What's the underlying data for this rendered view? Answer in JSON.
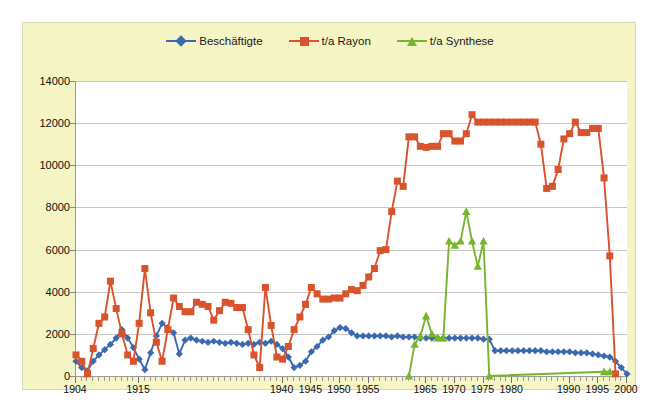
{
  "chart_data": {
    "type": "line",
    "title": "",
    "subtitle": "",
    "xlabel": "",
    "ylabel": "",
    "xlim": [
      1904,
      2000
    ],
    "ylim": [
      0,
      14000
    ],
    "ytick_values": [
      0,
      2000,
      4000,
      6000,
      8000,
      10000,
      12000,
      14000
    ],
    "ytick_labels": [
      "0",
      "2000",
      "4000",
      "6000",
      "8000",
      "10000",
      "12000",
      "14000"
    ],
    "xtick_labels": [
      "1904",
      "1915",
      "1940",
      "1945",
      "1950",
      "1955",
      "1965",
      "1970",
      "1975",
      "1980",
      "1990",
      "1995",
      "2000"
    ],
    "xtick_values": [
      1904,
      1915,
      1940,
      1945,
      1950,
      1955,
      1965,
      1970,
      1975,
      1980,
      1990,
      1995,
      2000
    ],
    "grid": true,
    "legend_position": "top-center",
    "series": [
      {
        "name": "Beschäftigte",
        "color": "#3b69b0",
        "marker": "diamond",
        "points": [
          [
            1904,
            700
          ],
          [
            1905,
            400
          ],
          [
            1906,
            250
          ],
          [
            1907,
            700
          ],
          [
            1908,
            1000
          ],
          [
            1909,
            1250
          ],
          [
            1910,
            1500
          ],
          [
            1911,
            1800
          ],
          [
            1912,
            2200
          ],
          [
            1913,
            1800
          ],
          [
            1914,
            1350
          ],
          [
            1915,
            800
          ],
          [
            1916,
            300
          ],
          [
            1917,
            1100
          ],
          [
            1918,
            1900
          ],
          [
            1919,
            2500
          ],
          [
            1920,
            2300
          ],
          [
            1921,
            2050
          ],
          [
            1922,
            1050
          ],
          [
            1923,
            1700
          ],
          [
            1924,
            1800
          ],
          [
            1925,
            1700
          ],
          [
            1926,
            1650
          ],
          [
            1927,
            1600
          ],
          [
            1928,
            1650
          ],
          [
            1929,
            1600
          ],
          [
            1930,
            1550
          ],
          [
            1931,
            1600
          ],
          [
            1932,
            1550
          ],
          [
            1933,
            1500
          ],
          [
            1934,
            1550
          ],
          [
            1935,
            1500
          ],
          [
            1936,
            1600
          ],
          [
            1937,
            1550
          ],
          [
            1938,
            1650
          ],
          [
            1939,
            1500
          ],
          [
            1940,
            1300
          ],
          [
            1941,
            900
          ],
          [
            1942,
            400
          ],
          [
            1943,
            500
          ],
          [
            1944,
            700
          ],
          [
            1945,
            1150
          ],
          [
            1946,
            1400
          ],
          [
            1947,
            1700
          ],
          [
            1948,
            1850
          ],
          [
            1949,
            2150
          ],
          [
            1950,
            2300
          ],
          [
            1951,
            2250
          ],
          [
            1952,
            2050
          ],
          [
            1953,
            1900
          ],
          [
            1954,
            1900
          ],
          [
            1955,
            1900
          ],
          [
            1956,
            1900
          ],
          [
            1957,
            1900
          ],
          [
            1958,
            1900
          ],
          [
            1959,
            1850
          ],
          [
            1960,
            1900
          ],
          [
            1961,
            1850
          ],
          [
            1962,
            1850
          ],
          [
            1963,
            1850
          ],
          [
            1964,
            1800
          ],
          [
            1965,
            1800
          ],
          [
            1966,
            1800
          ],
          [
            1967,
            1800
          ],
          [
            1968,
            1800
          ],
          [
            1969,
            1800
          ],
          [
            1970,
            1800
          ],
          [
            1971,
            1800
          ],
          [
            1972,
            1800
          ],
          [
            1973,
            1800
          ],
          [
            1974,
            1800
          ],
          [
            1975,
            1750
          ],
          [
            1976,
            1750
          ],
          [
            1977,
            1200
          ],
          [
            1978,
            1200
          ],
          [
            1979,
            1200
          ],
          [
            1980,
            1200
          ],
          [
            1981,
            1200
          ],
          [
            1982,
            1200
          ],
          [
            1983,
            1200
          ],
          [
            1984,
            1200
          ],
          [
            1985,
            1200
          ],
          [
            1986,
            1150
          ],
          [
            1987,
            1150
          ],
          [
            1988,
            1150
          ],
          [
            1989,
            1150
          ],
          [
            1990,
            1150
          ],
          [
            1991,
            1100
          ],
          [
            1992,
            1100
          ],
          [
            1993,
            1100
          ],
          [
            1994,
            1050
          ],
          [
            1995,
            1000
          ],
          [
            1996,
            950
          ],
          [
            1997,
            900
          ],
          [
            1998,
            700
          ],
          [
            1999,
            400
          ],
          [
            2000,
            100
          ]
        ]
      },
      {
        "name": "t/a Rayon",
        "color": "#d9532c",
        "marker": "square",
        "points": [
          [
            1904,
            1000
          ],
          [
            1905,
            700
          ],
          [
            1906,
            100
          ],
          [
            1907,
            1300
          ],
          [
            1908,
            2500
          ],
          [
            1909,
            2800
          ],
          [
            1910,
            4500
          ],
          [
            1911,
            3200
          ],
          [
            1912,
            2000
          ],
          [
            1913,
            1000
          ],
          [
            1914,
            700
          ],
          [
            1915,
            2500
          ],
          [
            1916,
            5100
          ],
          [
            1917,
            3000
          ],
          [
            1918,
            1600
          ],
          [
            1919,
            700
          ],
          [
            1920,
            2200
          ],
          [
            1921,
            3700
          ],
          [
            1922,
            3300
          ],
          [
            1923,
            3050
          ],
          [
            1924,
            3050
          ],
          [
            1925,
            3500
          ],
          [
            1926,
            3400
          ],
          [
            1927,
            3300
          ],
          [
            1928,
            2650
          ],
          [
            1929,
            3100
          ],
          [
            1930,
            3500
          ],
          [
            1931,
            3450
          ],
          [
            1932,
            3250
          ],
          [
            1933,
            3250
          ],
          [
            1934,
            2200
          ],
          [
            1935,
            1000
          ],
          [
            1936,
            400
          ],
          [
            1937,
            4200
          ],
          [
            1938,
            2400
          ],
          [
            1939,
            900
          ],
          [
            1940,
            800
          ],
          [
            1941,
            1400
          ],
          [
            1942,
            2200
          ],
          [
            1943,
            2800
          ],
          [
            1944,
            3400
          ],
          [
            1945,
            4200
          ],
          [
            1946,
            3900
          ],
          [
            1947,
            3650
          ],
          [
            1948,
            3650
          ],
          [
            1949,
            3700
          ],
          [
            1950,
            3700
          ],
          [
            1951,
            3900
          ],
          [
            1952,
            4100
          ],
          [
            1953,
            4050
          ],
          [
            1954,
            4300
          ],
          [
            1955,
            4700
          ],
          [
            1956,
            5100
          ],
          [
            1957,
            5950
          ],
          [
            1958,
            6000
          ],
          [
            1959,
            7800
          ],
          [
            1960,
            9250
          ],
          [
            1961,
            9000
          ],
          [
            1962,
            11350
          ],
          [
            1963,
            11350
          ],
          [
            1964,
            10900
          ],
          [
            1965,
            10850
          ],
          [
            1966,
            10900
          ],
          [
            1967,
            10900
          ],
          [
            1968,
            11500
          ],
          [
            1969,
            11500
          ],
          [
            1970,
            11150
          ],
          [
            1971,
            11150
          ],
          [
            1972,
            11500
          ],
          [
            1973,
            12400
          ],
          [
            1974,
            12050
          ],
          [
            1975,
            12050
          ],
          [
            1976,
            12050
          ],
          [
            1977,
            12050
          ],
          [
            1978,
            12050
          ],
          [
            1979,
            12050
          ],
          [
            1980,
            12050
          ],
          [
            1981,
            12050
          ],
          [
            1982,
            12050
          ],
          [
            1983,
            12050
          ],
          [
            1984,
            12050
          ],
          [
            1985,
            11000
          ],
          [
            1986,
            8900
          ],
          [
            1987,
            9000
          ],
          [
            1988,
            9800
          ],
          [
            1989,
            11250
          ],
          [
            1990,
            11500
          ],
          [
            1991,
            12050
          ],
          [
            1992,
            11550
          ],
          [
            1993,
            11550
          ],
          [
            1994,
            11750
          ],
          [
            1995,
            11750
          ],
          [
            1996,
            9400
          ],
          [
            1997,
            5700
          ],
          [
            1998,
            100
          ]
        ]
      },
      {
        "name": "t/a Synthese",
        "color": "#77b62c",
        "marker": "triangle",
        "points": [
          [
            1962,
            0
          ],
          [
            1963,
            1500
          ],
          [
            1964,
            1900
          ],
          [
            1965,
            2850
          ],
          [
            1966,
            2000
          ],
          [
            1967,
            1800
          ],
          [
            1968,
            1800
          ],
          [
            1969,
            6400
          ],
          [
            1970,
            6200
          ],
          [
            1971,
            6400
          ],
          [
            1972,
            7800
          ],
          [
            1973,
            6400
          ],
          [
            1974,
            5200
          ],
          [
            1975,
            6400
          ],
          [
            1976,
            0
          ],
          [
            1996,
            200
          ],
          [
            1997,
            200
          ]
        ]
      }
    ]
  },
  "legend": {
    "items": [
      {
        "label": "Beschäftigte",
        "color": "#3b69b0",
        "marker": "diamond"
      },
      {
        "label": "t/a Rayon",
        "color": "#d9532c",
        "marker": "square"
      },
      {
        "label": "t/a Synthese",
        "color": "#77b62c",
        "marker": "triangle"
      }
    ]
  }
}
